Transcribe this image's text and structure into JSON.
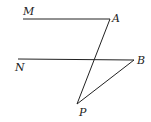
{
  "diagram": {
    "labels": {
      "M": "M",
      "N": "N",
      "A": "A",
      "B": "B",
      "P": "P"
    },
    "points": {
      "M": [
        23,
        19
      ],
      "A": [
        110,
        19
      ],
      "N": [
        18,
        59
      ],
      "B": [
        134,
        60
      ],
      "P": [
        77,
        104
      ]
    },
    "segments": [
      "MA",
      "NB",
      "AP",
      "BP"
    ],
    "stroke_color": "#222222"
  }
}
